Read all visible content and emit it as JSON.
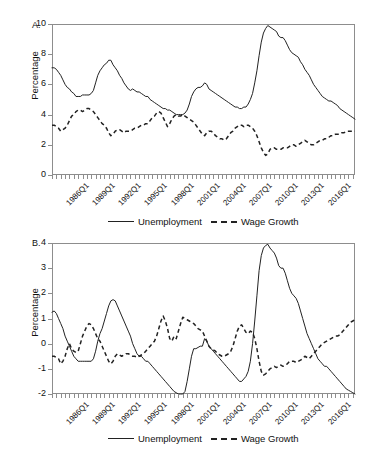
{
  "figure": {
    "panels": [
      {
        "label": "A.",
        "ylabel": "Percentage",
        "legend": [
          {
            "name": "Unemployment",
            "style": "solid"
          },
          {
            "name": "Wage Growth",
            "style": "dashed"
          }
        ]
      },
      {
        "label": "B.",
        "ylabel": "Percentage",
        "legend": [
          {
            "name": "Unemployment",
            "style": "solid"
          },
          {
            "name": "Wage Growth",
            "style": "dashed"
          }
        ]
      }
    ]
  },
  "chart_data": [
    {
      "type": "line",
      "panel": "A.",
      "title": "",
      "xlabel": "",
      "ylabel": "Percentage",
      "ylim": [
        0,
        10
      ],
      "yticks": [
        0,
        2,
        4,
        6,
        8,
        10
      ],
      "grid": false,
      "legend_position": "bottom",
      "xtick_labels": [
        "1986Q1",
        "1989Q1",
        "1992Q1",
        "1995Q1",
        "1998Q1",
        "2001Q1",
        "2004Q1",
        "2007Q1",
        "2010Q1",
        "2013Q1",
        "2016Q1"
      ],
      "xtick_interval_quarters": 12,
      "minor_tick_interval_quarters": 2,
      "x_start": "1986Q1",
      "x_end": "2018Q4",
      "series": [
        {
          "name": "Unemployment",
          "style": "solid",
          "values": [
            7.1,
            7.1,
            7.0,
            6.8,
            6.6,
            6.3,
            6.0,
            5.8,
            5.7,
            5.5,
            5.4,
            5.2,
            5.2,
            5.2,
            5.3,
            5.3,
            5.3,
            5.3,
            5.4,
            5.6,
            6.1,
            6.6,
            6.9,
            7.1,
            7.3,
            7.4,
            7.6,
            7.6,
            7.3,
            7.1,
            6.9,
            6.6,
            6.4,
            6.1,
            5.9,
            5.7,
            5.6,
            5.7,
            5.6,
            5.5,
            5.5,
            5.4,
            5.3,
            5.2,
            5.2,
            5.0,
            4.9,
            4.8,
            4.7,
            4.6,
            4.5,
            4.4,
            4.4,
            4.3,
            4.3,
            4.2,
            4.1,
            4.0,
            4.0,
            4.0,
            4.0,
            4.1,
            4.3,
            4.7,
            5.2,
            5.5,
            5.7,
            5.8,
            5.8,
            5.9,
            6.1,
            6.0,
            5.7,
            5.6,
            5.5,
            5.4,
            5.3,
            5.2,
            5.1,
            5.0,
            4.9,
            4.8,
            4.7,
            4.6,
            4.5,
            4.5,
            4.4,
            4.4,
            4.5,
            4.5,
            4.7,
            5.0,
            5.4,
            6.1,
            6.9,
            7.9,
            8.8,
            9.4,
            9.7,
            9.9,
            9.8,
            9.7,
            9.6,
            9.5,
            9.2,
            9.1,
            9.1,
            8.9,
            8.6,
            8.3,
            8.1,
            8.0,
            7.9,
            7.8,
            7.5,
            7.3,
            7.0,
            6.8,
            6.6,
            6.3,
            6.0,
            5.8,
            5.6,
            5.4,
            5.2,
            5.1,
            5.0,
            4.9,
            4.9,
            4.8,
            4.7,
            4.6,
            4.4,
            4.3,
            4.2,
            4.1,
            4.0,
            3.9,
            3.8,
            3.7
          ]
        },
        {
          "name": "Wage Growth",
          "style": "dashed",
          "values": [
            3.3,
            3.3,
            3.2,
            3.1,
            2.9,
            3.0,
            3.1,
            3.3,
            3.6,
            3.9,
            4.0,
            4.2,
            4.3,
            4.3,
            4.2,
            4.3,
            4.4,
            4.4,
            4.3,
            4.2,
            4.0,
            3.8,
            3.6,
            3.4,
            3.3,
            3.1,
            2.8,
            2.6,
            2.7,
            2.9,
            3.0,
            3.0,
            2.9,
            2.8,
            2.9,
            2.9,
            2.9,
            3.0,
            3.1,
            3.1,
            3.2,
            3.3,
            3.3,
            3.4,
            3.4,
            3.6,
            3.8,
            3.9,
            4.1,
            4.2,
            4.1,
            3.8,
            3.5,
            3.2,
            3.4,
            3.7,
            3.9,
            4.0,
            3.9,
            3.9,
            4.0,
            3.9,
            3.8,
            3.7,
            3.6,
            3.5,
            3.3,
            3.1,
            2.9,
            2.7,
            2.6,
            2.8,
            2.9,
            2.9,
            2.8,
            2.6,
            2.5,
            2.4,
            2.4,
            2.3,
            2.4,
            2.6,
            2.8,
            2.9,
            3.1,
            3.2,
            3.3,
            3.3,
            3.2,
            3.3,
            3.3,
            3.2,
            3.1,
            2.9,
            2.6,
            2.2,
            1.8,
            1.5,
            1.3,
            1.4,
            1.7,
            1.8,
            1.8,
            1.7,
            1.7,
            1.7,
            1.8,
            1.8,
            1.8,
            1.9,
            2.0,
            2.0,
            1.9,
            2.0,
            2.1,
            2.2,
            2.3,
            2.2,
            2.1,
            2.0,
            2.0,
            2.1,
            2.2,
            2.3,
            2.3,
            2.4,
            2.4,
            2.5,
            2.6,
            2.6,
            2.7,
            2.7,
            2.7,
            2.8,
            2.8,
            2.9,
            2.9,
            2.9,
            2.9,
            2.9
          ]
        }
      ]
    },
    {
      "type": "line",
      "panel": "B.",
      "title": "",
      "xlabel": "",
      "ylabel": "Percentage",
      "ylim": [
        -2,
        4
      ],
      "yticks": [
        -2,
        -1,
        0,
        1,
        2,
        3,
        4
      ],
      "grid": false,
      "legend_position": "bottom",
      "xtick_labels": [
        "1986Q1",
        "1989Q1",
        "1992Q1",
        "1995Q1",
        "1998Q1",
        "2001Q1",
        "2004Q1",
        "2007Q1",
        "2010Q1",
        "2013Q1",
        "2016Q1"
      ],
      "xtick_interval_quarters": 12,
      "minor_tick_interval_quarters": 2,
      "x_start": "1986Q1",
      "x_end": "2018Q4",
      "series": [
        {
          "name": "Unemployment",
          "style": "solid",
          "values": [
            1.25,
            1.3,
            1.2,
            1.0,
            0.8,
            0.6,
            0.3,
            0.1,
            -0.1,
            -0.3,
            -0.5,
            -0.6,
            -0.7,
            -0.7,
            -0.7,
            -0.7,
            -0.7,
            -0.7,
            -0.7,
            -0.6,
            -0.3,
            0.1,
            0.4,
            0.6,
            0.9,
            1.2,
            1.5,
            1.7,
            1.75,
            1.7,
            1.5,
            1.3,
            1.1,
            0.9,
            0.7,
            0.5,
            0.3,
            0.0,
            -0.2,
            -0.4,
            -0.5,
            -0.5,
            -0.6,
            -0.7,
            -0.7,
            -0.8,
            -0.9,
            -1.0,
            -1.1,
            -1.2,
            -1.3,
            -1.4,
            -1.5,
            -1.6,
            -1.7,
            -1.8,
            -1.9,
            -1.95,
            -2.0,
            -2.0,
            -2.0,
            -1.9,
            -1.5,
            -1.0,
            -0.5,
            -0.2,
            -0.2,
            -0.15,
            -0.1,
            -0.1,
            0.2,
            0.1,
            -0.1,
            -0.2,
            -0.3,
            -0.4,
            -0.5,
            -0.6,
            -0.7,
            -0.8,
            -0.9,
            -1.0,
            -1.1,
            -1.2,
            -1.3,
            -1.4,
            -1.5,
            -1.5,
            -1.4,
            -1.3,
            -1.1,
            -0.7,
            0.0,
            0.9,
            1.9,
            2.9,
            3.5,
            3.8,
            3.9,
            3.95,
            3.8,
            3.7,
            3.6,
            3.4,
            3.1,
            3.0,
            3.0,
            2.8,
            2.5,
            2.2,
            2.0,
            1.9,
            1.8,
            1.6,
            1.3,
            1.0,
            0.7,
            0.4,
            0.2,
            0.0,
            -0.2,
            -0.4,
            -0.6,
            -0.7,
            -0.8,
            -0.9,
            -0.9,
            -1.0,
            -1.1,
            -1.2,
            -1.3,
            -1.4,
            -1.5,
            -1.6,
            -1.7,
            -1.8,
            -1.85,
            -1.9,
            -1.95,
            -2.0
          ]
        },
        {
          "name": "Wage Growth",
          "style": "dashed",
          "values": [
            -0.5,
            -0.5,
            -0.55,
            -0.6,
            -0.8,
            -0.7,
            -0.5,
            -0.2,
            0.0,
            -0.2,
            -0.3,
            -0.35,
            -0.3,
            0.0,
            0.3,
            0.5,
            0.7,
            0.8,
            0.75,
            0.6,
            0.4,
            0.2,
            0.1,
            -0.1,
            -0.3,
            -0.5,
            -0.7,
            -0.8,
            -0.7,
            -0.5,
            -0.4,
            -0.45,
            -0.5,
            -0.45,
            -0.4,
            -0.4,
            -0.45,
            -0.5,
            -0.5,
            -0.55,
            -0.5,
            -0.45,
            -0.4,
            -0.3,
            -0.2,
            -0.1,
            0.0,
            0.1,
            0.3,
            0.6,
            0.9,
            1.1,
            0.9,
            0.6,
            0.2,
            0.1,
            0.3,
            0.2,
            0.5,
            0.8,
            1.05,
            1.0,
            0.95,
            0.9,
            0.85,
            0.8,
            0.7,
            0.6,
            0.55,
            0.5,
            0.3,
            0.1,
            -0.1,
            -0.2,
            -0.25,
            -0.3,
            -0.4,
            -0.45,
            -0.5,
            -0.5,
            -0.45,
            -0.4,
            -0.3,
            -0.1,
            0.2,
            0.5,
            0.7,
            0.75,
            0.6,
            0.45,
            0.4,
            0.5,
            0.45,
            0.2,
            -0.2,
            -0.7,
            -1.1,
            -1.25,
            -1.2,
            -1.1,
            -1.0,
            -0.95,
            -0.9,
            -0.95,
            -0.9,
            -0.85,
            -0.9,
            -0.85,
            -0.8,
            -0.7,
            -0.7,
            -0.7,
            -0.75,
            -0.7,
            -0.65,
            -0.6,
            -0.5,
            -0.55,
            -0.6,
            -0.5,
            -0.4,
            -0.3,
            -0.2,
            -0.1,
            0.0,
            0.05,
            0.1,
            0.15,
            0.2,
            0.25,
            0.3,
            0.3,
            0.35,
            0.45,
            0.55,
            0.65,
            0.75,
            0.85,
            0.9,
            0.95
          ]
        }
      ]
    }
  ]
}
